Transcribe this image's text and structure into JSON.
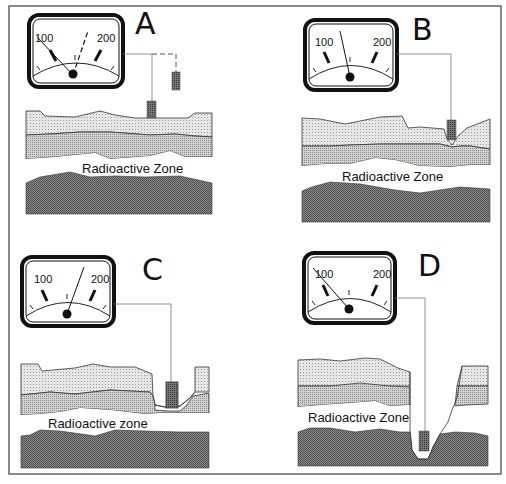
{
  "figure": {
    "border_color": "#555555"
  },
  "colors": {
    "gauge_frame": "#111111",
    "layer_top": "#d8d8d8",
    "layer_middle": "#bdbdbd",
    "radioactive_zone": "#ffffff",
    "bedrock": "#6e6e6e",
    "probe": "#5a5a5a",
    "line": "#777777"
  },
  "panels": [
    {
      "id": "A",
      "letter": "A",
      "gauge": {
        "label_low": "100",
        "label_high": "200",
        "needle_reading": "below 100",
        "needle_alt_dashed": "~155"
      },
      "zone_label": "Radioactive Zone",
      "probe_position": "at surface (dashed: above ground)"
    },
    {
      "id": "B",
      "letter": "B",
      "gauge": {
        "label_low": "100",
        "label_high": "200",
        "needle_reading": "~140"
      },
      "zone_label": "Radioactive Zone",
      "probe_position": "shallow hole in top layer"
    },
    {
      "id": "C",
      "letter": "C",
      "gauge": {
        "label_low": "100",
        "label_high": "200",
        "needle_reading": "~165"
      },
      "zone_label": "Radioactive zone",
      "probe_position": "bottom of middle layer"
    },
    {
      "id": "D",
      "letter": "D",
      "gauge": {
        "label_low": "100",
        "label_high": "200",
        "needle_reading": "below 100"
      },
      "zone_label": "Radioactive Zone",
      "probe_position": "in bedrock below radioactive zone"
    }
  ]
}
